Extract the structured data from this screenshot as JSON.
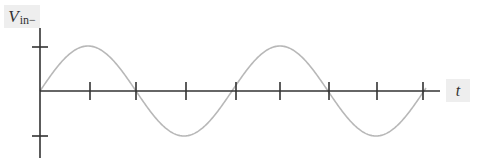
{
  "diagram": {
    "y_axis": {
      "label_main": "V",
      "label_sub": "in−",
      "ticks_px": [
        47,
        136
      ]
    },
    "x_axis": {
      "label": "t",
      "ticks_px": [
        90,
        136,
        186,
        236,
        280,
        329,
        377,
        423
      ]
    },
    "colors": {
      "axis": "#333333",
      "wave": "#b8b8b8",
      "label_bg": "#eeeeee"
    }
  },
  "chart_data": {
    "type": "line",
    "title": "",
    "xlabel": "t",
    "ylabel": "V_in-",
    "series": [
      {
        "name": "V_in-",
        "function": "sine",
        "amplitude": 1,
        "periods_shown": 2,
        "phase_start": 0
      }
    ],
    "x_ticks": 8,
    "y_ticks": [
      1,
      -1
    ],
    "ylim": [
      -1.4,
      1.4
    ],
    "grid": false,
    "legend": "none"
  }
}
